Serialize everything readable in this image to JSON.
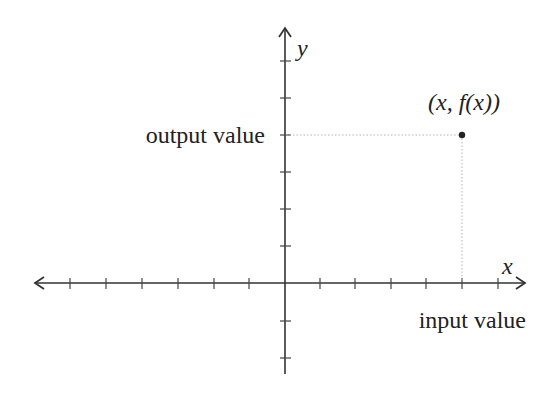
{
  "diagram": {
    "type": "cartesian-function-point",
    "axes": {
      "x_label": "x",
      "y_label": "y",
      "origin_px": [
        285,
        283
      ],
      "tick_spacing_px": 36,
      "x_ticks_left": 6,
      "x_ticks_right": 6,
      "y_ticks_up": 6,
      "y_ticks_down": 2
    },
    "point": {
      "label": "(x, f(x))",
      "px": [
        462,
        135
      ]
    },
    "labels": {
      "output": "output value",
      "input": "input value"
    },
    "colors": {
      "axis": "#333333",
      "guide": "#bbbbbb",
      "text": "#222222"
    }
  }
}
